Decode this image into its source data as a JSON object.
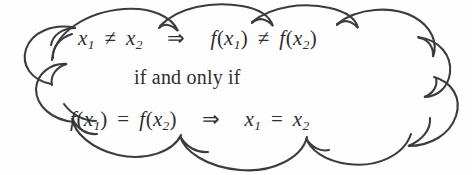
{
  "figure": {
    "kind": "hand-drawn-cloud-annotation",
    "shape_name": "cloud-callout",
    "background_color": "#fefefe",
    "stroke_color": "#3c3c3e",
    "text_color": "#2e2e30"
  },
  "lines": [
    {
      "id": "line-1",
      "plain_text": "x₁ ≠ x₂  ⇒  f(x₁) ≠ f(x₂)",
      "tokens": {
        "var_x": "x",
        "sub_1": "1",
        "sub_2": "2",
        "not_equal": "≠",
        "implies": "⇒",
        "fname": "f",
        "paren_open": "(",
        "paren_close": ")"
      }
    },
    {
      "id": "line-2",
      "plain_text": "if and only if",
      "tokens": {
        "phrase": "if and only if"
      }
    },
    {
      "id": "line-3",
      "plain_text": "f(x₁) = f(x₂)  ⇒  x₁ = x₂",
      "tokens": {
        "var_x": "x",
        "sub_1": "1",
        "sub_2": "2",
        "equals": "=",
        "implies": "⇒",
        "fname": "f",
        "paren_open": "(",
        "paren_close": ")"
      }
    }
  ]
}
